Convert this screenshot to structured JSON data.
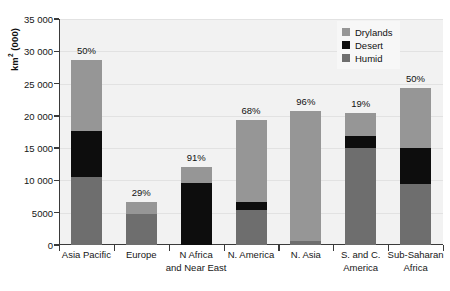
{
  "chart_data": {
    "type": "bar",
    "subtype": "stacked-bar",
    "title": "",
    "xlabel": "",
    "ylabel": "km² (000)",
    "ylim": [
      0,
      35000
    ],
    "yticks": [
      0,
      5000,
      10000,
      15000,
      20000,
      25000,
      30000,
      35000
    ],
    "ytick_labels": [
      "0",
      "5000",
      "10 000",
      "15 000",
      "20 000",
      "25 000",
      "30 000",
      "35 000"
    ],
    "grid": true,
    "legend_position": "top-right",
    "categories": [
      "Asia Pacific",
      "Europe",
      "N Africa\nand Near East",
      "N. America",
      "N. Asia",
      "S. and C.\nAmerica",
      "Sub-Saharan\nAfrica"
    ],
    "series": [
      {
        "name": "Humid",
        "color": "#6e6e6e",
        "values": [
          10600,
          4750,
          0,
          5500,
          600,
          15100,
          9450
        ]
      },
      {
        "name": "Desert",
        "color": "#0d0d0d",
        "values": [
          7100,
          0,
          9650,
          1100,
          0,
          1750,
          5550
        ]
      },
      {
        "name": "Drylands",
        "color": "#969696",
        "values": [
          11000,
          1950,
          2450,
          12700,
          20100,
          3650,
          9300
        ]
      }
    ],
    "totals": [
      28700,
      6700,
      12100,
      19300,
      20700,
      20500,
      24300
    ],
    "annotations": {
      "label": "percent drylands",
      "values": [
        "50%",
        "29%",
        "91%",
        "68%",
        "96%",
        "19%",
        "50%"
      ]
    }
  },
  "legend": {
    "items": [
      {
        "label": "Drylands",
        "color": "#969696"
      },
      {
        "label": "Desert",
        "color": "#0d0d0d"
      },
      {
        "label": "Humid",
        "color": "#6e6e6e"
      }
    ]
  },
  "axis": {
    "y_title_main": "km",
    "y_title_sup": "2",
    "y_title_unit": " (000)"
  },
  "colors": {
    "plot_background": "#f2f2f2",
    "page_background": "#ffffff",
    "axis_line": "#3a3a3a",
    "gridline": "#e2e2e2",
    "text": "#161616"
  }
}
